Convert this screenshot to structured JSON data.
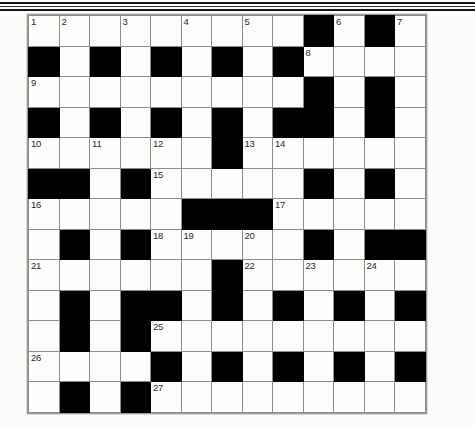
{
  "page": {
    "background_color": "#fcfcfb",
    "paper_tone": "#fdfdfc"
  },
  "decor": {
    "top_rules": [
      {
        "name": "scan-rule-1",
        "color": "#141414"
      },
      {
        "name": "scan-rule-2",
        "color": "#2e2e2e"
      },
      {
        "name": "scan-rule-3",
        "color": "#171717"
      }
    ]
  },
  "crossword": {
    "title": "Crossword Grid",
    "rows": 13,
    "cols": 13,
    "cell_size_px": 30.5,
    "block_color": "#000000",
    "cell_color": "#fdfdfc",
    "grid_line_color": "#8b8d8b",
    "number_color": "#2a2a2a",
    "legend": "1 = white (fillable) cell, 0 = black (blocked) cell",
    "cells": [
      [
        1,
        1,
        1,
        1,
        1,
        1,
        1,
        1,
        1,
        0,
        1,
        0,
        1
      ],
      [
        0,
        1,
        0,
        1,
        0,
        1,
        0,
        1,
        0,
        1,
        1,
        1,
        1
      ],
      [
        1,
        1,
        1,
        1,
        1,
        1,
        1,
        1,
        1,
        0,
        1,
        0,
        1
      ],
      [
        0,
        1,
        0,
        1,
        0,
        1,
        0,
        1,
        0,
        0,
        1,
        0,
        1
      ],
      [
        1,
        1,
        1,
        1,
        1,
        1,
        0,
        1,
        1,
        1,
        1,
        1,
        1
      ],
      [
        0,
        0,
        1,
        0,
        1,
        1,
        1,
        1,
        1,
        0,
        1,
        0,
        1
      ],
      [
        1,
        1,
        1,
        1,
        1,
        0,
        0,
        0,
        1,
        1,
        1,
        1,
        1
      ],
      [
        1,
        0,
        1,
        0,
        1,
        1,
        1,
        1,
        1,
        0,
        1,
        0,
        0
      ],
      [
        1,
        1,
        1,
        1,
        1,
        1,
        0,
        1,
        1,
        1,
        1,
        1,
        1
      ],
      [
        1,
        0,
        1,
        0,
        0,
        1,
        0,
        1,
        0,
        1,
        0,
        1,
        0
      ],
      [
        1,
        0,
        1,
        0,
        1,
        1,
        1,
        1,
        1,
        1,
        1,
        1,
        1
      ],
      [
        1,
        1,
        1,
        1,
        0,
        1,
        0,
        1,
        0,
        1,
        0,
        1,
        0
      ],
      [
        1,
        0,
        1,
        0,
        1,
        1,
        1,
        1,
        1,
        1,
        1,
        1,
        1
      ]
    ],
    "numbers": [
      {
        "n": "1",
        "row": 0,
        "col": 0
      },
      {
        "n": "2",
        "row": 0,
        "col": 1
      },
      {
        "n": "3",
        "row": 0,
        "col": 3
      },
      {
        "n": "4",
        "row": 0,
        "col": 5
      },
      {
        "n": "5",
        "row": 0,
        "col": 7
      },
      {
        "n": "6",
        "row": 0,
        "col": 10
      },
      {
        "n": "7",
        "row": 0,
        "col": 12
      },
      {
        "n": "8",
        "row": 1,
        "col": 9
      },
      {
        "n": "9",
        "row": 2,
        "col": 0
      },
      {
        "n": "10",
        "row": 4,
        "col": 0
      },
      {
        "n": "11",
        "row": 4,
        "col": 2
      },
      {
        "n": "12",
        "row": 4,
        "col": 4
      },
      {
        "n": "13",
        "row": 4,
        "col": 7
      },
      {
        "n": "14",
        "row": 4,
        "col": 8
      },
      {
        "n": "15",
        "row": 5,
        "col": 4
      },
      {
        "n": "16",
        "row": 6,
        "col": 0
      },
      {
        "n": "17",
        "row": 6,
        "col": 8
      },
      {
        "n": "18",
        "row": 7,
        "col": 4
      },
      {
        "n": "19",
        "row": 7,
        "col": 5
      },
      {
        "n": "20",
        "row": 7,
        "col": 7
      },
      {
        "n": "21",
        "row": 8,
        "col": 0
      },
      {
        "n": "22",
        "row": 8,
        "col": 7
      },
      {
        "n": "23",
        "row": 8,
        "col": 9
      },
      {
        "n": "24",
        "row": 8,
        "col": 11
      },
      {
        "n": "25",
        "row": 10,
        "col": 4
      },
      {
        "n": "26",
        "row": 11,
        "col": 0
      },
      {
        "n": "27",
        "row": 12,
        "col": 4
      }
    ]
  }
}
